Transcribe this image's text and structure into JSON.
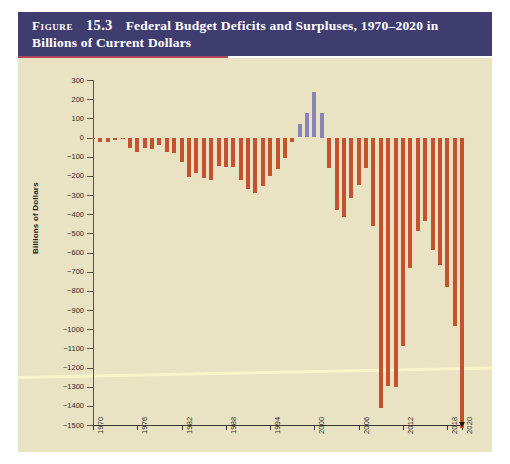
{
  "figure": {
    "label": "Figure",
    "number": "15.3",
    "title": "Federal Budget Deficits and Surpluses, 1970–2020 in Billions of Current Dollars",
    "banner_color": "#3f3c70",
    "panel_color": "#e9e3c4",
    "rule_color": "#b2475c"
  },
  "chart_data": {
    "type": "bar",
    "title": "Federal Budget Deficits and Surpluses, 1970–2020 in Billions of Current Dollars",
    "xlabel": "",
    "ylabel": "Billions of Dollars",
    "ylim": [
      -1500,
      300
    ],
    "ytick_step": 100,
    "grid": false,
    "legend": "none",
    "deficit_color": "#c4522e",
    "surplus_color": "#8a83b6",
    "yticks": [
      300,
      200,
      100,
      0,
      -100,
      -200,
      -300,
      -400,
      -500,
      -600,
      -700,
      -800,
      -900,
      -1000,
      -1100,
      -1200,
      -1300,
      -1400,
      -1500
    ],
    "ytick_labels": [
      "300",
      "200",
      "100",
      "0",
      "−100",
      "−200",
      "−300",
      "−400",
      "−500",
      "−600",
      "−700",
      "−800",
      "−900",
      "−1000",
      "−1100",
      "−1200",
      "−1300",
      "−1400",
      "−1500"
    ],
    "xticks": [
      1970,
      1976,
      1982,
      1988,
      1994,
      2000,
      2006,
      2012,
      2018,
      2020
    ],
    "xtick_labels": [
      "1970",
      "1976",
      "1982",
      "1988",
      "1994",
      "2000",
      "2006",
      "2012",
      "2018",
      "2020"
    ],
    "categories": [
      1970,
      1971,
      1972,
      1973,
      1974,
      1975,
      1976,
      1977,
      1978,
      1979,
      1980,
      1981,
      1982,
      1983,
      1984,
      1985,
      1986,
      1987,
      1988,
      1989,
      1990,
      1991,
      1992,
      1993,
      1994,
      1995,
      1996,
      1997,
      1998,
      1999,
      2000,
      2001,
      2002,
      2003,
      2004,
      2005,
      2006,
      2007,
      2008,
      2009,
      2010,
      2011,
      2012,
      2013,
      2014,
      2015,
      2016,
      2017,
      2018,
      2019,
      2020
    ],
    "values": [
      -3,
      -23,
      -23,
      -15,
      -6,
      -53,
      -74,
      -54,
      -59,
      -41,
      -74,
      -79,
      -128,
      -208,
      -185,
      -212,
      -221,
      -150,
      -155,
      -153,
      -221,
      -269,
      -290,
      -255,
      -203,
      -164,
      -107,
      -22,
      69,
      126,
      236,
      128,
      -158,
      -378,
      -413,
      -318,
      -248,
      -161,
      -459,
      -1413,
      -1294,
      -1300,
      -1087,
      -680,
      -485,
      -438,
      -585,
      -665,
      -779,
      -984,
      -3132
    ],
    "annotations": [
      {
        "year": 2020,
        "note": "bar extends below the −1500 axis limit; arrowhead marks the clipped value"
      }
    ]
  }
}
